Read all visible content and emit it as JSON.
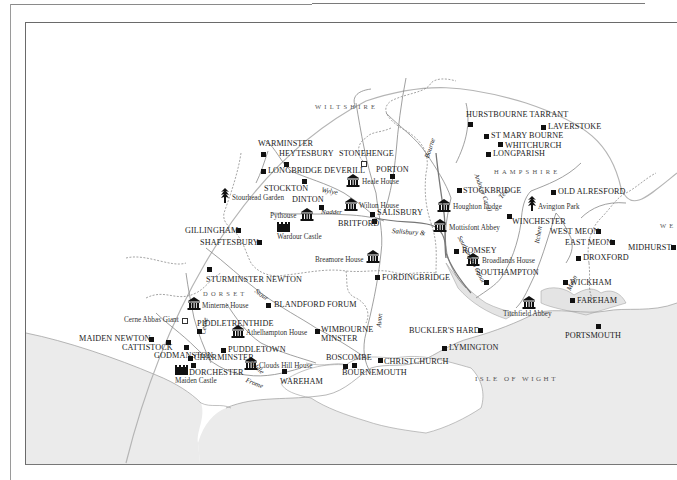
{
  "map": {
    "colors": {
      "sea": "#ebebeb",
      "land": "#ffffff",
      "frame": "#6a6a6a",
      "boundary_arc": "#b0b0b0",
      "markers": "#111111"
    },
    "counties": [
      {
        "id": "wiltshire",
        "label": "WILTSHIRE"
      },
      {
        "id": "hampshire",
        "label": "HAMPSHIRE"
      },
      {
        "id": "dorset",
        "label": "DORSET"
      },
      {
        "id": "west-sussex",
        "label": "WE"
      }
    ],
    "island": {
      "label": "ISLE OF WIGHT"
    },
    "rivers": [
      {
        "id": "bourne",
        "label": "Bourne"
      },
      {
        "id": "wylye",
        "label": "Wylye"
      },
      {
        "id": "nadder",
        "label": "Nadder"
      },
      {
        "id": "test",
        "label": "Test"
      },
      {
        "id": "andover-canal",
        "label": "Andover Canal"
      },
      {
        "id": "salisbury-canal",
        "label": "Salisbury &"
      },
      {
        "id": "southampton-canal",
        "label": "Southampton Canal"
      },
      {
        "id": "itchen",
        "label": "Itchen"
      },
      {
        "id": "meon",
        "label": "Meon"
      },
      {
        "id": "avon",
        "label": "Avon"
      },
      {
        "id": "stour",
        "label": "Stour"
      },
      {
        "id": "cerne",
        "label": "Cerne"
      },
      {
        "id": "piddle",
        "label": "Piddle"
      },
      {
        "id": "frome",
        "label": "Frome"
      }
    ],
    "towns": [
      {
        "id": "warminster",
        "label": "WARMINSTER"
      },
      {
        "id": "heytesbury",
        "label": "HEYTESBURY"
      },
      {
        "id": "longbridge-deverill",
        "label": "LONGBRIDGE DEVERILL"
      },
      {
        "id": "stockton",
        "label": "STOCKTON"
      },
      {
        "id": "dinton",
        "label": "DINTON"
      },
      {
        "id": "stonehenge",
        "label": "STONEHENGE"
      },
      {
        "id": "porton",
        "label": "PORTON"
      },
      {
        "id": "salisbury",
        "label": "SALISBURY"
      },
      {
        "id": "britford",
        "label": "BRITFORD"
      },
      {
        "id": "gillingham",
        "label": "GILLINGHAM"
      },
      {
        "id": "shaftesbury",
        "label": "SHAFTESBURY"
      },
      {
        "id": "sturminster-newton",
        "label": "STURMINSTER NEWTON"
      },
      {
        "id": "blandford-forum",
        "label": "BLANDFORD FORUM"
      },
      {
        "id": "piddletrenthide",
        "label": "PIDDLETRENTHIDE"
      },
      {
        "id": "maiden-newton",
        "label": "MAIDEN NEWTON"
      },
      {
        "id": "cattistock",
        "label": "CATTISTOCK"
      },
      {
        "id": "godmanston",
        "label": "GODMANSTON"
      },
      {
        "id": "charminster",
        "label": "CHARMINSTER"
      },
      {
        "id": "puddletown",
        "label": "PUDDLETOWN"
      },
      {
        "id": "dorchester",
        "label": "DORCHESTER"
      },
      {
        "id": "wareham",
        "label": "WAREHAM"
      },
      {
        "id": "wimbourne-minster",
        "label": "WIMBOURNE MINSTER"
      },
      {
        "id": "boscombe",
        "label": "BOSCOMBE"
      },
      {
        "id": "bournemouth",
        "label": "BOURNEMOUTH"
      },
      {
        "id": "christchurch",
        "label": "CHRISTCHURCH"
      },
      {
        "id": "fordingbridge",
        "label": "FORDINGBRIDGE"
      },
      {
        "id": "bucklers-hard",
        "label": "BUCKLER'S HARD"
      },
      {
        "id": "lymington",
        "label": "LYMINGTON"
      },
      {
        "id": "hurstbourne-tarrant",
        "label": "HURSTBOURNE TARRANT"
      },
      {
        "id": "laverstoke",
        "label": "LAVERSTOKE"
      },
      {
        "id": "st-mary-bourne",
        "label": "ST MARY BOURNE"
      },
      {
        "id": "whitchurch",
        "label": "WHITCHURCH"
      },
      {
        "id": "longparish",
        "label": "LONGPARISH"
      },
      {
        "id": "stockbridge",
        "label": "STOCKBRIDGE"
      },
      {
        "id": "old-alresford",
        "label": "OLD ALRESFORD"
      },
      {
        "id": "winchester",
        "label": "WINCHESTER"
      },
      {
        "id": "west-meon",
        "label": "WEST MEON"
      },
      {
        "id": "east-meon",
        "label": "EAST MEON"
      },
      {
        "id": "romsey",
        "label": "ROMSEY"
      },
      {
        "id": "droxford",
        "label": "DROXFORD"
      },
      {
        "id": "southampton",
        "label": "SOUTHAMPTON"
      },
      {
        "id": "wickham",
        "label": "WICKHAM"
      },
      {
        "id": "fareham",
        "label": "FAREHAM"
      },
      {
        "id": "portsmouth",
        "label": "PORTSMOUTH"
      },
      {
        "id": "midhurst",
        "label": "MIDHURST"
      }
    ],
    "sites": [
      {
        "id": "stourhead-garden",
        "label": "Stourhead Garden",
        "icon": "garden"
      },
      {
        "id": "pythouse",
        "label": "Pythouse",
        "icon": "house"
      },
      {
        "id": "wilton-house",
        "label": "Wilton House",
        "icon": "house"
      },
      {
        "id": "heale-house",
        "label": "Heale House",
        "icon": "house"
      },
      {
        "id": "wardour-castle",
        "label": "Wardour Castle",
        "icon": "castle"
      },
      {
        "id": "breamore-house",
        "label": "Breamore House",
        "icon": "house"
      },
      {
        "id": "houghton-lodge",
        "label": "Houghton Lodge",
        "icon": "house"
      },
      {
        "id": "mottisfont-abbey",
        "label": "Mottisfont Abbey",
        "icon": "house"
      },
      {
        "id": "broadlands-house",
        "label": "Broadlands House",
        "icon": "house"
      },
      {
        "id": "avington-park",
        "label": "Avington Park",
        "icon": "garden"
      },
      {
        "id": "titchfield-abbey",
        "label": "Titchfield Abbey",
        "icon": "house"
      },
      {
        "id": "minterne-house",
        "label": "Minterne House",
        "icon": "house"
      },
      {
        "id": "cerne-abbas-giant",
        "label": "Cerne Abbas Giant",
        "icon": "monument"
      },
      {
        "id": "athelhampton-house",
        "label": "Athelhampton House",
        "icon": "house"
      },
      {
        "id": "clouds-hill-house",
        "label": "Clouds Hill House",
        "icon": "house"
      },
      {
        "id": "maiden-castle",
        "label": "Maiden Castle",
        "icon": "castle"
      }
    ]
  }
}
